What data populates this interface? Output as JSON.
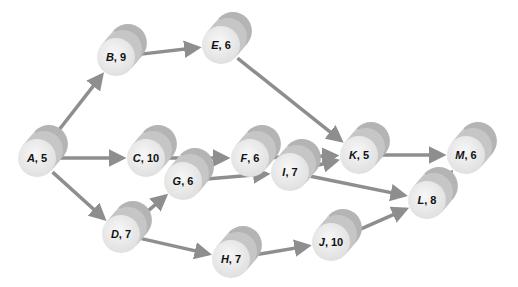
{
  "diagram": {
    "type": "activity-network",
    "colors": {
      "arrow": "#8e8e8e",
      "cylinder_face": "#ececec",
      "cylinder_body": "#b9b9b9",
      "label": "#111111"
    },
    "nodes": [
      {
        "id": "A",
        "letter": "A",
        "duration": "5",
        "x": 37,
        "y": 158
      },
      {
        "id": "B",
        "letter": "B",
        "duration": "9",
        "x": 116,
        "y": 57
      },
      {
        "id": "C",
        "letter": "C",
        "duration": "10",
        "x": 146,
        "y": 158
      },
      {
        "id": "D",
        "letter": "D",
        "duration": "7",
        "x": 121,
        "y": 234
      },
      {
        "id": "E",
        "letter": "E",
        "duration": "6",
        "x": 221,
        "y": 45
      },
      {
        "id": "F",
        "letter": "F",
        "duration": "6",
        "x": 250,
        "y": 158
      },
      {
        "id": "G",
        "letter": "G",
        "duration": "6",
        "x": 183,
        "y": 181
      },
      {
        "id": "H",
        "letter": "H",
        "duration": "7",
        "x": 231,
        "y": 259
      },
      {
        "id": "I",
        "letter": "I",
        "duration": "7",
        "x": 290,
        "y": 172
      },
      {
        "id": "J",
        "letter": "J",
        "duration": "10",
        "x": 331,
        "y": 242
      },
      {
        "id": "K",
        "letter": "K",
        "duration": "5",
        "x": 359,
        "y": 155
      },
      {
        "id": "L",
        "letter": "L",
        "duration": "8",
        "x": 427,
        "y": 200
      },
      {
        "id": "M",
        "letter": "M",
        "duration": "6",
        "x": 466,
        "y": 155
      }
    ],
    "edges": [
      {
        "from": "A",
        "to": "B"
      },
      {
        "from": "A",
        "to": "C"
      },
      {
        "from": "A",
        "to": "D"
      },
      {
        "from": "B",
        "to": "E"
      },
      {
        "from": "C",
        "to": "F"
      },
      {
        "from": "E",
        "to": "K"
      },
      {
        "from": "F",
        "to": "K"
      },
      {
        "from": "D",
        "to": "G"
      },
      {
        "from": "D",
        "to": "H"
      },
      {
        "from": "G",
        "to": "I"
      },
      {
        "from": "I",
        "to": "K"
      },
      {
        "from": "I",
        "to": "L"
      },
      {
        "from": "H",
        "to": "J"
      },
      {
        "from": "J",
        "to": "L"
      },
      {
        "from": "K",
        "to": "M"
      },
      {
        "from": "L",
        "to": "M"
      }
    ]
  }
}
